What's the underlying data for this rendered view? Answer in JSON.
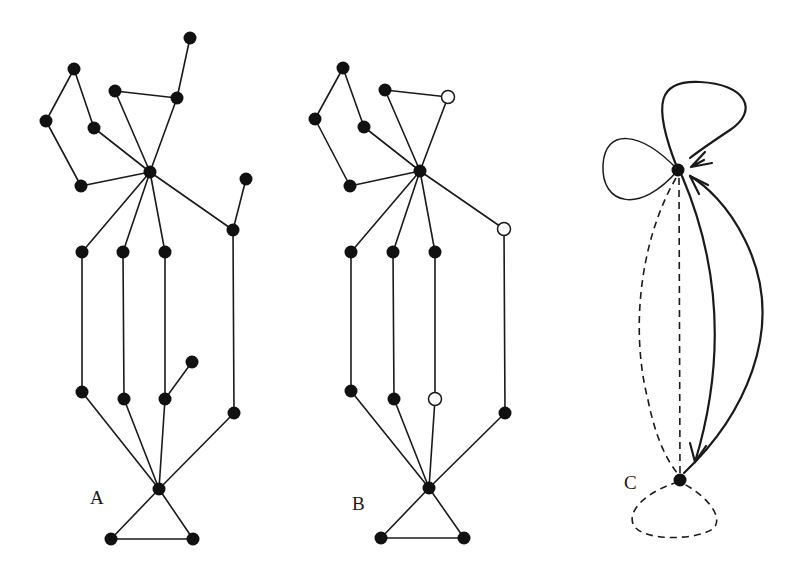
{
  "figure": {
    "panels": [
      {
        "id": "A",
        "label": "A",
        "label_pos": [
          90,
          504
        ],
        "nodes": [
          {
            "id": "a1",
            "x": 190,
            "y": 38,
            "type": "filled"
          },
          {
            "id": "a2",
            "x": 74,
            "y": 69,
            "type": "filled"
          },
          {
            "id": "a3",
            "x": 115,
            "y": 91,
            "type": "filled"
          },
          {
            "id": "a4",
            "x": 177,
            "y": 98,
            "type": "filled"
          },
          {
            "id": "a5",
            "x": 46,
            "y": 121,
            "type": "filled"
          },
          {
            "id": "a6",
            "x": 94,
            "y": 128,
            "type": "filled"
          },
          {
            "id": "a7",
            "x": 150,
            "y": 172,
            "type": "filled"
          },
          {
            "id": "a8",
            "x": 81,
            "y": 186,
            "type": "filled"
          },
          {
            "id": "a9",
            "x": 246,
            "y": 179,
            "type": "filled"
          },
          {
            "id": "a10",
            "x": 233,
            "y": 230,
            "type": "filled"
          },
          {
            "id": "a11",
            "x": 82,
            "y": 252,
            "type": "filled"
          },
          {
            "id": "a12",
            "x": 123,
            "y": 252,
            "type": "filled"
          },
          {
            "id": "a13",
            "x": 165,
            "y": 252,
            "type": "filled"
          },
          {
            "id": "a14",
            "x": 82,
            "y": 392,
            "type": "filled"
          },
          {
            "id": "a15",
            "x": 124,
            "y": 399,
            "type": "filled"
          },
          {
            "id": "a16",
            "x": 165,
            "y": 399,
            "type": "filled"
          },
          {
            "id": "a17",
            "x": 192,
            "y": 362,
            "type": "filled"
          },
          {
            "id": "a18",
            "x": 234,
            "y": 413,
            "type": "filled"
          },
          {
            "id": "a19",
            "x": 159,
            "y": 489,
            "type": "filled"
          },
          {
            "id": "a20",
            "x": 111,
            "y": 539,
            "type": "filled"
          },
          {
            "id": "a21",
            "x": 193,
            "y": 539,
            "type": "filled"
          }
        ],
        "edges": [
          [
            "a1",
            "a4"
          ],
          [
            "a4",
            "a3"
          ],
          [
            "a4",
            "a7"
          ],
          [
            "a3",
            "a7"
          ],
          [
            "a2",
            "a5"
          ],
          [
            "a2",
            "a6"
          ],
          [
            "a6",
            "a7"
          ],
          [
            "a5",
            "a8"
          ],
          [
            "a8",
            "a7"
          ],
          [
            "a7",
            "a10"
          ],
          [
            "a9",
            "a10"
          ],
          [
            "a7",
            "a11"
          ],
          [
            "a7",
            "a12"
          ],
          [
            "a7",
            "a13"
          ],
          [
            "a11",
            "a14"
          ],
          [
            "a12",
            "a15"
          ],
          [
            "a13",
            "a16"
          ],
          [
            "a16",
            "a17"
          ],
          [
            "a10",
            "a18"
          ],
          [
            "a14",
            "a19"
          ],
          [
            "a15",
            "a19"
          ],
          [
            "a16",
            "a19"
          ],
          [
            "a18",
            "a19"
          ],
          [
            "a19",
            "a20"
          ],
          [
            "a19",
            "a21"
          ],
          [
            "a20",
            "a21"
          ]
        ]
      },
      {
        "id": "B",
        "label": "B",
        "label_pos": [
          352,
          510
        ],
        "nodes": [
          {
            "id": "b2",
            "x": 343,
            "y": 68,
            "type": "filled"
          },
          {
            "id": "b3",
            "x": 385,
            "y": 90,
            "type": "filled"
          },
          {
            "id": "b4",
            "x": 448,
            "y": 97,
            "type": "open"
          },
          {
            "id": "b5",
            "x": 315,
            "y": 119,
            "type": "filled"
          },
          {
            "id": "b6",
            "x": 364,
            "y": 127,
            "type": "filled"
          },
          {
            "id": "b7",
            "x": 420,
            "y": 171,
            "type": "filled"
          },
          {
            "id": "b8",
            "x": 350,
            "y": 186,
            "type": "filled"
          },
          {
            "id": "b10",
            "x": 504,
            "y": 229,
            "type": "open"
          },
          {
            "id": "b11",
            "x": 351,
            "y": 252,
            "type": "filled"
          },
          {
            "id": "b12",
            "x": 393,
            "y": 252,
            "type": "filled"
          },
          {
            "id": "b13",
            "x": 435,
            "y": 252,
            "type": "filled"
          },
          {
            "id": "b14",
            "x": 351,
            "y": 391,
            "type": "filled"
          },
          {
            "id": "b15",
            "x": 394,
            "y": 399,
            "type": "filled"
          },
          {
            "id": "b16",
            "x": 435,
            "y": 399,
            "type": "open"
          },
          {
            "id": "b18",
            "x": 505,
            "y": 413,
            "type": "filled"
          },
          {
            "id": "b19",
            "x": 429,
            "y": 488,
            "type": "filled"
          },
          {
            "id": "b20",
            "x": 381,
            "y": 538,
            "type": "filled"
          },
          {
            "id": "b21",
            "x": 464,
            "y": 538,
            "type": "filled"
          }
        ],
        "edges": [
          [
            "b3",
            "b4"
          ],
          [
            "b4",
            "b7"
          ],
          [
            "b3",
            "b7"
          ],
          [
            "b2",
            "b5"
          ],
          [
            "b2",
            "b6"
          ],
          [
            "b6",
            "b7"
          ],
          [
            "b5",
            "b8"
          ],
          [
            "b8",
            "b7"
          ],
          [
            "b7",
            "b10"
          ],
          [
            "b7",
            "b11"
          ],
          [
            "b7",
            "b12"
          ],
          [
            "b7",
            "b13"
          ],
          [
            "b11",
            "b14"
          ],
          [
            "b12",
            "b15"
          ],
          [
            "b13",
            "b16"
          ],
          [
            "b10",
            "b18"
          ],
          [
            "b14",
            "b19"
          ],
          [
            "b15",
            "b19"
          ],
          [
            "b16",
            "b19"
          ],
          [
            "b18",
            "b19"
          ],
          [
            "b19",
            "b20"
          ],
          [
            "b19",
            "b21"
          ],
          [
            "b20",
            "b21"
          ]
        ]
      },
      {
        "id": "C",
        "label": "C",
        "label_pos": [
          624,
          489
        ],
        "nodes": [
          {
            "id": "c_top",
            "x": 678,
            "y": 170,
            "type": "filled"
          },
          {
            "id": "c_bottom",
            "x": 680,
            "y": 480,
            "type": "filled"
          }
        ],
        "curves": [
          {
            "name": "upper-loop",
            "style": "thick",
            "d": "M678,170 C650,100 660,80 700,82 C745,84 760,110 730,130 C712,142 700,150 690,158",
            "arrow": "towards-top-node"
          },
          {
            "name": "left-loop",
            "style": "thin",
            "d": "M678,170 C640,130 605,128 603,165 C601,205 640,215 678,170"
          },
          {
            "name": "outer-dashed-edge",
            "style": "dashed",
            "d": "M676,178 C640,240 630,330 648,400 C656,440 668,462 678,474"
          },
          {
            "name": "straight-dashed-edge",
            "style": "dashed",
            "d": "M679,178 L680,474"
          },
          {
            "name": "inner-solid-edge",
            "style": "thick",
            "d": "M682,176 C705,230 735,330 695,462",
            "arrow": "towards-bottom-node"
          },
          {
            "name": "outer-solid-edge",
            "style": "thick",
            "d": "M684,473 C740,420 790,330 745,240 C728,205 705,185 690,176",
            "arrow": "towards-top-node-side"
          },
          {
            "name": "bottom-dashed-loop",
            "style": "dashed",
            "d": "M678,482 C650,490 625,510 634,526 C645,542 700,540 714,528 C724,516 705,495 684,484"
          }
        ],
        "arrowheads": [
          {
            "name": "upper-loop-arrow",
            "d": "M691,167 L712,163 M691,167 L705,152 M691,167 L704,160"
          },
          {
            "name": "inner-edge-arrow",
            "d": "M695,462 L690,443 M695,462 L706,446"
          },
          {
            "name": "outer-edge-arrow",
            "d": "M690,176 L708,185 M690,176 L699,194"
          }
        ]
      }
    ]
  }
}
